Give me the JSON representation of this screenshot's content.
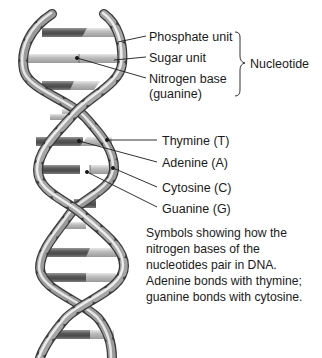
{
  "diagram": {
    "nucleotide_labels": [
      {
        "text": "Phosphate unit"
      },
      {
        "text": "Sugar unit"
      },
      {
        "text": "Nitrogen base"
      },
      {
        "text": "(guanine)"
      }
    ],
    "group_label": "Nucleotide",
    "base_labels": [
      {
        "text": "Thymine (T)"
      },
      {
        "text": "Adenine (A)"
      },
      {
        "text": "Cytosine (C)"
      },
      {
        "text": "Guanine (G)"
      }
    ],
    "caption_lines": [
      "Symbols showing how the",
      "nitrogen bases of the",
      "nucleotides pair in DNA.",
      "Adenine bonds with thymine;",
      "guanine bonds with cytosine."
    ],
    "colors": {
      "strand_light": "#d0d0d0",
      "strand_mid": "#8a8a8a",
      "strand_dark": "#3a3a3a",
      "leader_line": "#1a1a1a"
    }
  }
}
